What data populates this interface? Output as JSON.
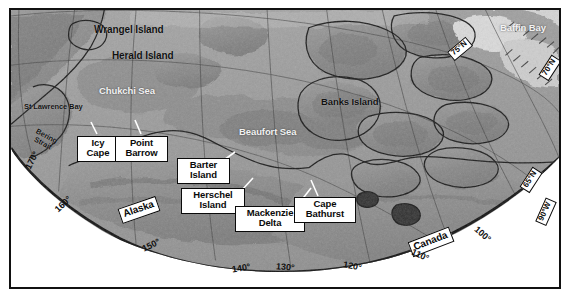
{
  "figure": {
    "kind": "map",
    "projection": "polar stereographic",
    "style": "grayscale shaded relief",
    "frame_color": "#111111",
    "ocean_color": "#9c9c9c",
    "land_color": "#8a8a8a",
    "ice_color": "#d8d8d8",
    "label_box_fill": "#ffffff",
    "label_box_stroke": "#0a0a0a"
  },
  "sea_labels": [
    {
      "name": "chukchi-sea",
      "text": "Chukchi Sea",
      "x": 88,
      "y": 76,
      "size": 9.5
    },
    {
      "name": "beaufort-sea",
      "text": "Beaufort Sea",
      "x": 228,
      "y": 117,
      "size": 9.5
    },
    {
      "name": "baffin-bay",
      "text": "Baffin Bay",
      "x": 489,
      "y": 13,
      "size": 9.5
    }
  ],
  "island_labels": [
    {
      "name": "wrangel-island",
      "text": "Wrangel Island",
      "x": 83,
      "y": 15,
      "size": 10
    },
    {
      "name": "herald-island",
      "text": "Herald Island",
      "x": 101,
      "y": 41,
      "size": 10
    },
    {
      "name": "banks-island",
      "text": "Banks Island",
      "x": 310,
      "y": 87,
      "size": 9.5
    },
    {
      "name": "st-lawrence-bay",
      "text": "St Lawrence Bay",
      "x": 13,
      "y": 93,
      "size": 7.5
    }
  ],
  "boxed_labels": [
    {
      "name": "icy-cape",
      "line1": "Icy",
      "line2": "Cape",
      "x": 75,
      "y": 126,
      "w": 34,
      "size": 9.5,
      "leader": {
        "x": 35,
        "y": -9,
        "len": 13,
        "angle": -72
      }
    },
    {
      "name": "point-barrow",
      "line1": "Point",
      "line2": "Barrow",
      "x": 111,
      "y": 126,
      "w": 45,
      "size": 9.5,
      "leader": {
        "x": 30,
        "y": -9,
        "len": 14,
        "angle": -78
      }
    },
    {
      "name": "barter-island",
      "line1": "Barter",
      "line2": "Island",
      "x": 175,
      "y": 147,
      "w": 45,
      "size": 9.5,
      "leader": {
        "x": 46,
        "y": 3,
        "len": 15,
        "angle": -38
      }
    },
    {
      "name": "herschel-island",
      "line1": "Herschel",
      "line2": "Island",
      "x": 186,
      "y": 178,
      "w": 55,
      "size": 9.5,
      "leader": {
        "x": 56,
        "y": 2,
        "len": 19,
        "angle": -47
      }
    },
    {
      "name": "mackenzie-delta",
      "line1": "Mackenzie",
      "line2": "Delta",
      "x": 234,
      "y": 196,
      "w": 62,
      "size": 9.5,
      "leader": {
        "x": 58,
        "y": 0,
        "len": 24,
        "angle": -52
      }
    },
    {
      "name": "cape-bathurst",
      "line1": "Cape",
      "line2": "Bathurst",
      "x": 292,
      "y": 187,
      "w": 54,
      "size": 9.5,
      "leader": {
        "x": 22,
        "y": -5,
        "len": 20,
        "angle": -72
      }
    }
  ],
  "country_labels": [
    {
      "name": "alaska",
      "text": "Alaska",
      "x": 117,
      "y": 196,
      "rot": -19,
      "size": 10
    },
    {
      "name": "canada",
      "text": "Canada",
      "x": 407,
      "y": 228,
      "rot": -21,
      "size": 10
    }
  ],
  "graticule": {
    "longitudes_boxed": [
      {
        "name": "lon-90w",
        "text": "90°W",
        "x": 531,
        "y": 202,
        "rot": -66
      }
    ],
    "longitudes_plain": [
      {
        "name": "lon-170",
        "text": "170°",
        "x": 20,
        "y": 152,
        "rot": -62
      },
      {
        "name": "lon-160",
        "text": "160°",
        "x": 51,
        "y": 196,
        "rot": -44
      },
      {
        "name": "lon-150",
        "text": "150°",
        "x": 139,
        "y": 237,
        "rot": -26
      },
      {
        "name": "lon-140",
        "text": "140°",
        "x": 229,
        "y": 259,
        "rot": -10
      },
      {
        "name": "lon-130",
        "text": "130°",
        "x": 273,
        "y": 258,
        "rot": 5
      },
      {
        "name": "lon-120",
        "text": "120°",
        "x": 340,
        "y": 258,
        "rot": 10
      },
      {
        "name": "lon-110",
        "text": "110°",
        "x": 408,
        "y": 247,
        "rot": 24
      },
      {
        "name": "lon-100",
        "text": "100°",
        "x": 470,
        "y": 226,
        "rot": 41
      }
    ],
    "latitudes_boxed": [
      {
        "name": "lat-75n",
        "text": "75°N",
        "x": 446,
        "y": 40,
        "rot": -40
      },
      {
        "name": "lat-70n",
        "text": "70°N",
        "x": 535,
        "y": 58,
        "rot": -57
      },
      {
        "name": "lat-65n",
        "text": "65°N",
        "x": 518,
        "y": 170,
        "rot": -57
      }
    ],
    "bering_strait": {
      "name": "bering-strait",
      "line1": "Bering",
      "line2": "Strait",
      "x": 25,
      "y": 126,
      "rot": 28
    }
  }
}
